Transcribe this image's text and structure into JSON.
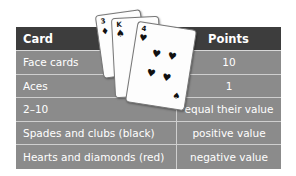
{
  "table": {
    "headers": [
      "Card",
      "Points"
    ],
    "rows": [
      {
        "card": "Face cards",
        "points": "10"
      },
      {
        "card": "Aces",
        "points": "1"
      },
      {
        "card": "2–10",
        "points": "equal their value"
      },
      {
        "card": "Spades and clubs (black)",
        "points": "positive value"
      },
      {
        "card": "Hearts and diamonds (red)",
        "points": "negative value"
      }
    ]
  },
  "illustration": {
    "cards": [
      {
        "rank": "3",
        "suit": "♦"
      },
      {
        "rank": "K",
        "suit": "♠"
      },
      {
        "rank": "4",
        "suit": "♥",
        "pips": [
          "♥",
          "♥",
          "♥",
          "♥"
        ],
        "corner_suit": "♠"
      }
    ]
  },
  "colors": {
    "header_bg": "#3d3d3d",
    "row_bg": "#8b8b8b",
    "divider": "#cfcfcf",
    "text": "#ffffff"
  }
}
